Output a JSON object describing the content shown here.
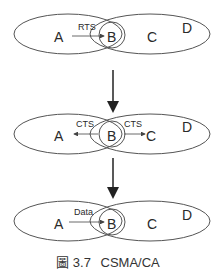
{
  "panels": [
    {
      "nodes": {
        "a": "A",
        "b": "B",
        "c": "C",
        "d": "D"
      },
      "arrows": [
        {
          "label": "RTS",
          "from": "A",
          "to": "B"
        }
      ]
    },
    {
      "nodes": {
        "a": "A",
        "b": "B",
        "c": "C",
        "d": "D"
      },
      "arrows": [
        {
          "label": "CTS",
          "from": "B",
          "to": "A"
        },
        {
          "label": "CTS",
          "from": "B",
          "to": "C"
        }
      ]
    },
    {
      "nodes": {
        "a": "A",
        "b": "B",
        "c": "C",
        "d": "D"
      },
      "arrows": [
        {
          "label": "Data",
          "from": "A",
          "to": "B"
        }
      ]
    }
  ],
  "caption": {
    "figure": "圖 3.7",
    "title": "CSMA/CA"
  },
  "colors": {
    "stroke": "#555555",
    "text": "#2a2a2a"
  }
}
